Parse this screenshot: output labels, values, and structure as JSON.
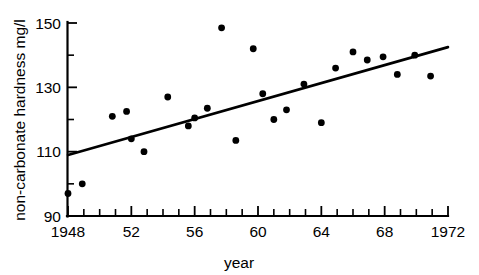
{
  "chart_data": {
    "type": "scatter",
    "title": "",
    "xlabel": "year",
    "ylabel": "non-carbonate hardness mg/l",
    "xlim": [
      1948,
      1972
    ],
    "ylim": [
      90,
      150
    ],
    "grid": false,
    "legend": null,
    "x_major_ticks": [
      1948,
      1952,
      1956,
      1960,
      1964,
      1968,
      1972
    ],
    "x_major_tick_labels": [
      "1948",
      "52",
      "56",
      "60",
      "64",
      "68",
      "1972"
    ],
    "x_minor_tick_step": 1,
    "y_major_ticks": [
      90,
      110,
      130,
      150
    ],
    "y_major_tick_labels": [
      "90",
      "110",
      "130",
      "150"
    ],
    "y_minor_ticks": [
      100,
      120,
      140
    ],
    "points": [
      {
        "x": 1948.0,
        "y": 97.0
      },
      {
        "x": 1948.9,
        "y": 100.0
      },
      {
        "x": 1950.8,
        "y": 121.0
      },
      {
        "x": 1951.7,
        "y": 122.5
      },
      {
        "x": 1952.0,
        "y": 114.0
      },
      {
        "x": 1952.8,
        "y": 110.0
      },
      {
        "x": 1954.3,
        "y": 127.0
      },
      {
        "x": 1955.6,
        "y": 118.0
      },
      {
        "x": 1956.0,
        "y": 120.5
      },
      {
        "x": 1956.8,
        "y": 123.5
      },
      {
        "x": 1957.7,
        "y": 148.5
      },
      {
        "x": 1958.6,
        "y": 113.5
      },
      {
        "x": 1959.7,
        "y": 142.0
      },
      {
        "x": 1960.3,
        "y": 128.0
      },
      {
        "x": 1961.0,
        "y": 120.0
      },
      {
        "x": 1961.8,
        "y": 123.0
      },
      {
        "x": 1962.9,
        "y": 131.0
      },
      {
        "x": 1964.0,
        "y": 119.0
      },
      {
        "x": 1964.9,
        "y": 136.0
      },
      {
        "x": 1966.0,
        "y": 141.0
      },
      {
        "x": 1966.9,
        "y": 138.5
      },
      {
        "x": 1967.9,
        "y": 139.5
      },
      {
        "x": 1968.8,
        "y": 134.0
      },
      {
        "x": 1969.9,
        "y": 140.0
      },
      {
        "x": 1970.9,
        "y": 133.5
      }
    ],
    "trend_line": {
      "x_start": 1948,
      "y_start": 109.0,
      "x_end": 1972,
      "y_end": 142.5
    }
  }
}
